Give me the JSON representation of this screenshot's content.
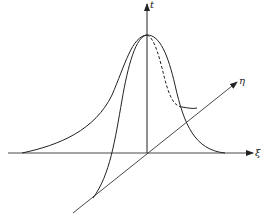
{
  "diagram": {
    "type": "3d-surface-sketch",
    "axes": {
      "vertical": {
        "label": "t"
      },
      "horizontal": {
        "label": "ξ"
      },
      "oblique": {
        "label": "η"
      }
    },
    "stroke_color": "#222222",
    "background": "#ffffff"
  }
}
